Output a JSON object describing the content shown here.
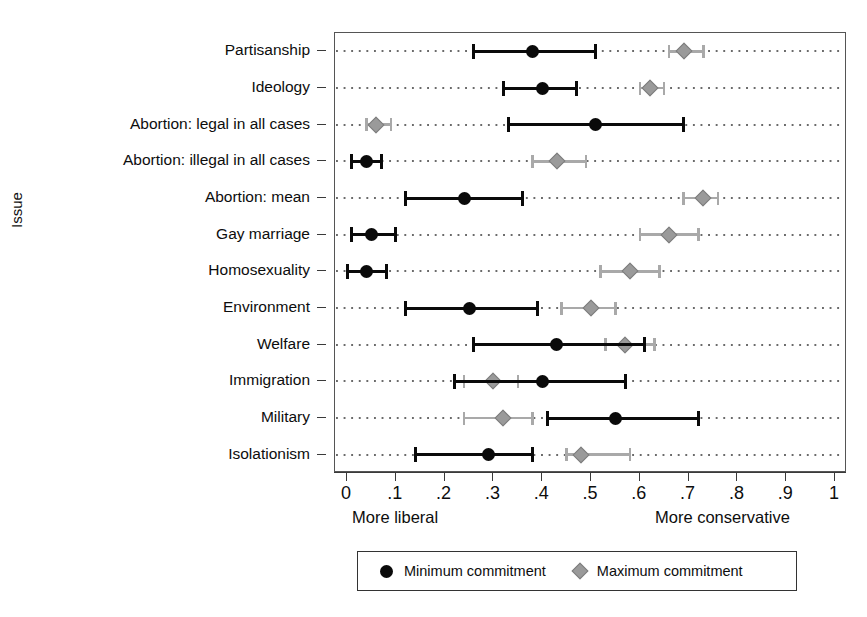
{
  "axes": {
    "ylabel": "Issue",
    "xticklabels": [
      "0",
      ".1",
      ".2",
      ".3",
      ".4",
      ".5",
      ".6",
      ".7",
      ".8",
      ".9",
      "1"
    ],
    "left_caption": "More liberal",
    "right_caption": "More conservative"
  },
  "legend": {
    "items": [
      {
        "label": "Minimum commitment",
        "marker": "filled-circle",
        "color": "#0a0a0a"
      },
      {
        "label": "Maximum commitment",
        "marker": "filled-diamond",
        "color": "#9a9a9a"
      }
    ]
  },
  "chart_data": {
    "type": "scatter",
    "title": "",
    "xlabel": "",
    "ylabel": "Issue",
    "xlim": [
      0,
      1
    ],
    "xticks": [
      0,
      0.1,
      0.2,
      0.3,
      0.4,
      0.5,
      0.6,
      0.7,
      0.8,
      0.9,
      1
    ],
    "grid": "horizontal-dotted",
    "legend_position": "bottom",
    "x_annotations": {
      "left": "More liberal",
      "right": "More conservative"
    },
    "categories": [
      "Partisanship",
      "Ideology",
      "Abortion: legal in all cases",
      "Abortion: illegal in all cases",
      "Abortion: mean",
      "Gay marriage",
      "Homosexuality",
      "Environment",
      "Welfare",
      "Immigration",
      "Military",
      "Isolationism"
    ],
    "series": [
      {
        "name": "Minimum commitment",
        "color": "#0a0a0a",
        "marker": "filled-circle",
        "values": [
          0.38,
          0.4,
          0.51,
          0.04,
          0.24,
          0.05,
          0.04,
          0.25,
          0.43,
          0.4,
          0.55,
          0.29
        ],
        "ci_low": [
          0.26,
          0.32,
          0.33,
          0.01,
          0.12,
          0.01,
          0.0,
          0.12,
          0.26,
          0.22,
          0.41,
          0.14
        ],
        "ci_high": [
          0.51,
          0.47,
          0.69,
          0.07,
          0.36,
          0.1,
          0.08,
          0.39,
          0.61,
          0.57,
          0.72,
          0.38
        ]
      },
      {
        "name": "Maximum commitment",
        "color": "#9a9a9a",
        "marker": "filled-diamond",
        "values": [
          0.69,
          0.62,
          0.06,
          0.43,
          0.73,
          0.66,
          0.58,
          0.5,
          0.57,
          0.3,
          0.32,
          0.48
        ],
        "ci_low": [
          0.66,
          0.6,
          0.04,
          0.38,
          0.69,
          0.6,
          0.52,
          0.44,
          0.53,
          0.24,
          0.24,
          0.45
        ],
        "ci_high": [
          0.73,
          0.65,
          0.09,
          0.49,
          0.76,
          0.72,
          0.64,
          0.55,
          0.63,
          0.35,
          0.38,
          0.58
        ]
      }
    ]
  }
}
